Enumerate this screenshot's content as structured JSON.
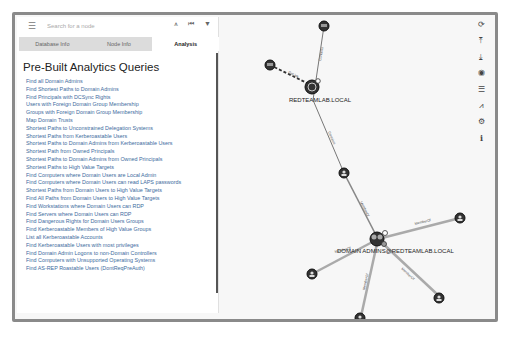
{
  "search": {
    "placeholder": "Search for a node",
    "menu_icon": "hamburger-icon",
    "toolbar_icons": [
      "pathfinding-icon",
      "back-icon",
      "filter-icon"
    ]
  },
  "tabs": [
    {
      "label": "Database Info",
      "active": false
    },
    {
      "label": "Node Info",
      "active": false
    },
    {
      "label": "Analysis",
      "active": true
    }
  ],
  "panel": {
    "title": "Pre-Built Analytics Queries",
    "queries": [
      "Find all Domain Admins",
      "Find Shortest Paths to Domain Admins",
      "Find Principals with DCSync Rights",
      "Users with Foreign Domain Group Membership",
      "Groups with Foreign Domain Group Membership",
      "Map Domain Trusts",
      "Shortest Paths to Unconstrained Delegation Systems",
      "Shortest Paths from Kerberoastable Users",
      "Shortest Paths to Domain Admins from Kerberoastable Users",
      "Shortest Path from Owned Principals",
      "Shortest Paths to Domain Admins from Owned Principals",
      "Shortest Paths to High Value Targets",
      "Find Computers where Domain Users are Local Admin",
      "Find Computers where Domain Users can read LAPS passwords",
      "Shortest Paths from Domain Users to High Value Targets",
      "Find All Paths from Domain Users to High Value Targets",
      "Find Workstations where Domain Users can RDP",
      "Find Servers where Domain Users can RDP",
      "Find Dangerous Rights for Domain Users Groups",
      "Find Kerberoastable Members of High Value Groups",
      "List all Kerberoastable Accounts",
      "Find Kerberoastable Users with most privileges",
      "Find Domain Admin Logons to non-Domain Controllers",
      "Find Computers with Unsupported Operating Systems",
      "Find AS-REP Roastable Users (DontReqPreAuth)"
    ]
  },
  "right_toolbar": [
    {
      "icon": "refresh-icon",
      "glyph": "⟳"
    },
    {
      "icon": "export-icon",
      "glyph": "⤒"
    },
    {
      "icon": "import-icon",
      "glyph": "⤓"
    },
    {
      "icon": "upload-icon",
      "glyph": "◉"
    },
    {
      "icon": "queries-list-icon",
      "glyph": "☰"
    },
    {
      "icon": "chart-icon",
      "glyph": "⩘"
    },
    {
      "icon": "settings-icon",
      "glyph": "⚙"
    },
    {
      "icon": "info-icon",
      "glyph": "ℹ"
    }
  ],
  "graph": {
    "nodes": {
      "domain": {
        "label": "REDTEAMLAB.LOCAL"
      },
      "group": {
        "label": "DOMAIN ADMINS@REDTEAMLAB.LOCAL"
      }
    },
    "edges": {
      "contains_top": "Contains",
      "gplink": "GpLink",
      "contains_mid": "Contains",
      "member_of_mid": "MemberOf",
      "member_of_left": "MemberOf",
      "member_of_right": "MemberOf",
      "member_of_bl": "MemberOf",
      "member_of_br": "MemberOf"
    }
  },
  "watermark": "Pre-Built Analytics Queries"
}
